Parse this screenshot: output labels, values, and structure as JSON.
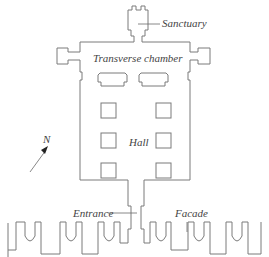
{
  "diagram": {
    "type": "floor-plan",
    "labels": {
      "sanctuary": "Sanctuary",
      "transverse_chamber": "Transverse chamber",
      "hall": "Hall",
      "entrance": "Entrance",
      "facade": "Facade",
      "north": "N"
    },
    "hall_pillars": 6,
    "chamber_blocks": 2,
    "colors": {
      "line": "#7a7a7a",
      "text": "#444444",
      "background": "#ffffff"
    }
  }
}
